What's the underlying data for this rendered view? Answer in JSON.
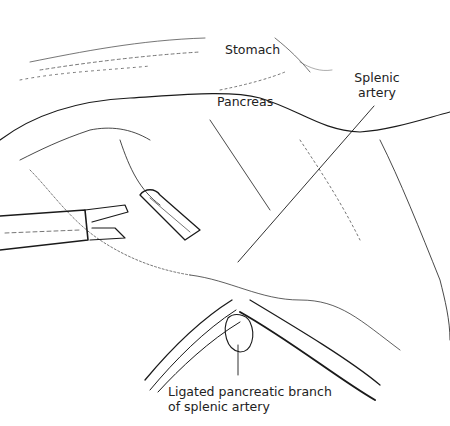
{
  "figure": {
    "type": "surgical line illustration",
    "labels": {
      "stomach": "Stomach",
      "pancreas": "Pancreas",
      "splenic_artery_line1": "Splenic",
      "splenic_artery_line2": "artery",
      "ligated_line1": "Ligated pancreatic branch",
      "ligated_line2": "of splenic artery"
    },
    "colors": {
      "ink": "#1a1a1a",
      "background": "#ffffff"
    }
  }
}
